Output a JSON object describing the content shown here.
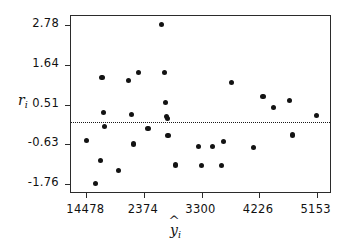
{
  "chart_data": {
    "type": "scatter",
    "title": "",
    "xlabel": "ŷᵢ",
    "ylabel": "rᵢ",
    "xlabel_base": "y",
    "xlabel_sub": "i",
    "ylabel_base": "r",
    "ylabel_sub": "i",
    "xlim": [
      1200,
      5400
    ],
    "ylim": [
      -2.05,
      3.05
    ],
    "grid": false,
    "legend": null,
    "xticks": [
      1448,
      2374,
      3300,
      4226,
      5153
    ],
    "xtick_labels": [
      "14478",
      "2374",
      "3300",
      "4226",
      "5153"
    ],
    "yticks": [
      2.78,
      1.64,
      0.51,
      -0.63,
      -1.76
    ],
    "ytick_labels": [
      "2.78",
      "1.64",
      "0.51",
      "-0.63",
      "-1.76"
    ],
    "reference_line": {
      "y": 0.0,
      "style": "dotted",
      "color": "#1a1a1a"
    },
    "marker": {
      "shape": "circle",
      "color": "#131313",
      "size": 5
    },
    "points": [
      {
        "x": 1448,
        "y": -0.52
      },
      {
        "x": 1600,
        "y": -1.76
      },
      {
        "x": 1680,
        "y": -1.1
      },
      {
        "x": 1700,
        "y": 1.28
      },
      {
        "x": 1720,
        "y": 0.28
      },
      {
        "x": 1740,
        "y": -0.12
      },
      {
        "x": 1960,
        "y": -1.38
      },
      {
        "x": 2120,
        "y": 1.21
      },
      {
        "x": 2180,
        "y": 0.23
      },
      {
        "x": 2200,
        "y": -0.62
      },
      {
        "x": 2280,
        "y": 1.42
      },
      {
        "x": 2440,
        "y": -0.18
      },
      {
        "x": 2650,
        "y": 2.8
      },
      {
        "x": 2700,
        "y": 1.42
      },
      {
        "x": 2720,
        "y": 0.58
      },
      {
        "x": 2740,
        "y": 0.17
      },
      {
        "x": 2750,
        "y": 0.11
      },
      {
        "x": 2760,
        "y": -0.38
      },
      {
        "x": 2880,
        "y": -1.22
      },
      {
        "x": 3250,
        "y": -0.7
      },
      {
        "x": 3300,
        "y": -1.24
      },
      {
        "x": 3480,
        "y": -0.68
      },
      {
        "x": 3620,
        "y": -1.24
      },
      {
        "x": 3660,
        "y": -0.55
      },
      {
        "x": 3780,
        "y": 1.15
      },
      {
        "x": 4140,
        "y": -0.72
      },
      {
        "x": 4290,
        "y": 0.74
      },
      {
        "x": 4460,
        "y": 0.42
      },
      {
        "x": 4720,
        "y": 0.62
      },
      {
        "x": 4760,
        "y": -0.36
      },
      {
        "x": 5153,
        "y": 0.2
      }
    ]
  }
}
